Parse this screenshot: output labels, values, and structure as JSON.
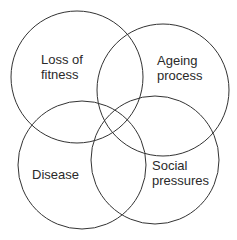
{
  "diagram": {
    "type": "venn",
    "stroke_color": "#333333",
    "circles": [
      {
        "id": "loss-of-fitness",
        "label_line1": "Loss of",
        "label_line2": "fitness",
        "cx": 77,
        "cy": 77,
        "r": 66
      },
      {
        "id": "ageing-process",
        "label_line1": "Ageing",
        "label_line2": "process",
        "cx": 163,
        "cy": 90,
        "r": 66
      },
      {
        "id": "disease",
        "label_line1": "Disease",
        "label_line2": "",
        "cx": 82,
        "cy": 165,
        "r": 64
      },
      {
        "id": "social-pressures",
        "label_line1": "Social",
        "label_line2": "pressures",
        "cx": 155,
        "cy": 160,
        "r": 64
      }
    ]
  }
}
